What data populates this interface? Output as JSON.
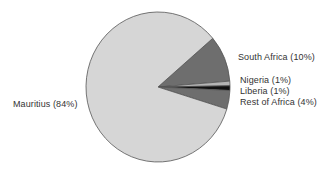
{
  "chart_data": {
    "type": "pie",
    "title": "",
    "start_angle_deg": 40.5,
    "direction": "clockwise",
    "slices": [
      {
        "label": "South Africa",
        "value": 10,
        "label_text": "South Africa (10%)",
        "color": "#6e6e6e"
      },
      {
        "label": "Nigeria",
        "value": 1,
        "label_text": "Nigeria (1%)",
        "color": "#b4b4b4"
      },
      {
        "label": "Liberia",
        "value": 1,
        "label_text": "Liberia (1%)",
        "color": "#111111"
      },
      {
        "label": "Rest of Africa",
        "value": 4,
        "label_text": "Rest of Africa (4%)",
        "color": "#6e6e6e"
      },
      {
        "label": "Mauritius",
        "value": 84,
        "label_text": "Mauritius (84%)",
        "color": "#d6d6d6"
      }
    ],
    "legend": "none (direct slice labels)",
    "outline_color": "#555555"
  },
  "labels": {
    "south_africa": "South Africa (10%)",
    "nigeria": "Nigeria (1%)",
    "liberia": "Liberia (1%)",
    "rest_of_africa": "Rest of Africa (4%)",
    "mauritius": "Mauritius (84%)"
  }
}
